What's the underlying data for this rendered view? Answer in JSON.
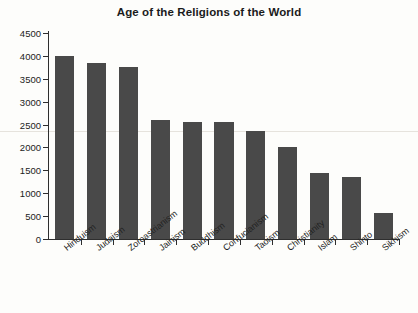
{
  "chart_data": {
    "type": "bar",
    "title": "Age of the Religions of the World",
    "xlabel": "",
    "ylabel": "",
    "ylim": [
      0,
      4500
    ],
    "ytick_step": 500,
    "yticks": [
      0,
      500,
      1000,
      1500,
      2000,
      2500,
      3000,
      3500,
      4000,
      4500
    ],
    "ytick_labels": [
      "0",
      "500",
      "1000",
      "1500",
      "2000",
      "2500",
      "3000",
      "3500",
      "4000",
      "4500"
    ],
    "grid": false,
    "legend": false,
    "bar_color": "#494949",
    "background_color": "#fdfdfb",
    "axis_color": "#2e2e2e",
    "categories": [
      "Hinduism",
      "Judaism",
      "Zoroastrianism",
      "Jainism",
      "Buddhism",
      "Confucianism",
      "Taoism",
      "Christianity",
      "Islam",
      "Shinto",
      "Sikhism"
    ],
    "values": [
      4000,
      3850,
      3750,
      2600,
      2550,
      2550,
      2350,
      2020,
      1450,
      1350,
      560
    ]
  }
}
